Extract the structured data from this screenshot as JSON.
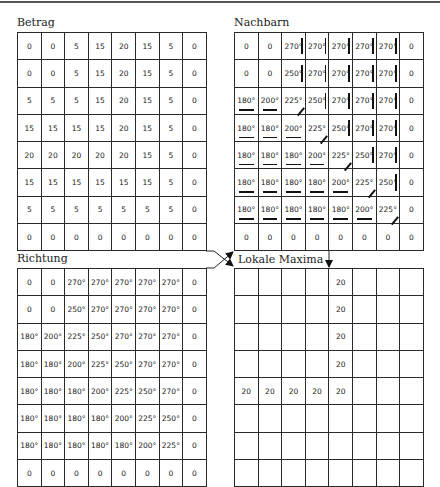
{
  "panels": {
    "betrag": {
      "title": "Betrag",
      "rows": [
        [
          "0",
          "0",
          "5",
          "15",
          "20",
          "15",
          "5",
          "0"
        ],
        [
          "0",
          "0",
          "5",
          "15",
          "20",
          "15",
          "5",
          "0"
        ],
        [
          "5",
          "5",
          "5",
          "15",
          "20",
          "15",
          "5",
          "0"
        ],
        [
          "15",
          "15",
          "15",
          "15",
          "20",
          "15",
          "5",
          "0"
        ],
        [
          "20",
          "20",
          "20",
          "20",
          "20",
          "15",
          "5",
          "0"
        ],
        [
          "15",
          "15",
          "15",
          "15",
          "15",
          "15",
          "5",
          "0"
        ],
        [
          "5",
          "5",
          "5",
          "5",
          "5",
          "5",
          "5",
          "0"
        ],
        [
          "0",
          "0",
          "0",
          "0",
          "0",
          "0",
          "0",
          "0"
        ]
      ]
    },
    "nachbarn": {
      "title": "Nachbarn",
      "rows": [
        [
          "0",
          "0",
          "270°",
          "270°",
          "270°",
          "270°",
          "270°",
          "0"
        ],
        [
          "0",
          "0",
          "250°",
          "270°",
          "270°",
          "270°",
          "270°",
          "0"
        ],
        [
          "180°",
          "200°",
          "225°",
          "250°",
          "270°",
          "270°",
          "270°",
          "0"
        ],
        [
          "180°",
          "180°",
          "200°",
          "225°",
          "250°",
          "270°",
          "270°",
          "0"
        ],
        [
          "180°",
          "180°",
          "180°",
          "200°",
          "225°",
          "250°",
          "270°",
          "0"
        ],
        [
          "180°",
          "180°",
          "180°",
          "180°",
          "200°",
          "225°",
          "250°",
          "0"
        ],
        [
          "180°",
          "180°",
          "180°",
          "180°",
          "180°",
          "200°",
          "225°",
          "0"
        ],
        [
          "0",
          "0",
          "0",
          "0",
          "0",
          "0",
          "0",
          "0"
        ]
      ],
      "markers": [
        [
          "none",
          "none",
          "vertical",
          "vertical",
          "vertical",
          "vertical",
          "vertical",
          "none"
        ],
        [
          "none",
          "none",
          "vertical",
          "vertical",
          "vertical",
          "vertical",
          "vertical",
          "none"
        ],
        [
          "underline",
          "underline",
          "diagonal",
          "vertical",
          "vertical",
          "vertical",
          "vertical",
          "none"
        ],
        [
          "underline",
          "underline",
          "underline",
          "diagonal",
          "vertical",
          "vertical",
          "vertical",
          "none"
        ],
        [
          "underline",
          "underline",
          "underline",
          "underline",
          "diagonal",
          "vertical",
          "vertical",
          "none"
        ],
        [
          "underline",
          "underline",
          "underline",
          "underline",
          "underline",
          "diagonal",
          "vertical",
          "none"
        ],
        [
          "underline",
          "underline",
          "underline",
          "underline",
          "underline",
          "underline",
          "diagonal",
          "none"
        ],
        [
          "none",
          "none",
          "none",
          "none",
          "none",
          "none",
          "none",
          "none"
        ]
      ]
    },
    "richtung": {
      "title": "Richtung",
      "rows": [
        [
          "0",
          "0",
          "270°",
          "270°",
          "270°",
          "270°",
          "270°",
          "0"
        ],
        [
          "0",
          "0",
          "250°",
          "270°",
          "270°",
          "270°",
          "270°",
          "0"
        ],
        [
          "180°",
          "200°",
          "225°",
          "250°",
          "270°",
          "270°",
          "270°",
          "0"
        ],
        [
          "180°",
          "180°",
          "200°",
          "225°",
          "250°",
          "270°",
          "270°",
          "0"
        ],
        [
          "180°",
          "180°",
          "180°",
          "200°",
          "225°",
          "250°",
          "270°",
          "0"
        ],
        [
          "180°",
          "180°",
          "180°",
          "180°",
          "200°",
          "225°",
          "250°",
          "0"
        ],
        [
          "180°",
          "180°",
          "180°",
          "180°",
          "180°",
          "200°",
          "225°",
          "0"
        ],
        [
          "0",
          "0",
          "0",
          "0",
          "0",
          "0",
          "0",
          "0"
        ]
      ]
    },
    "lokale_maxima": {
      "title": "Lokale Maxima",
      "rows": [
        [
          "",
          "",
          "",
          "",
          "20",
          "",
          "",
          ""
        ],
        [
          "",
          "",
          "",
          "",
          "20",
          "",
          "",
          ""
        ],
        [
          "",
          "",
          "",
          "",
          "20",
          "",
          "",
          ""
        ],
        [
          "",
          "",
          "",
          "",
          "20",
          "",
          "",
          ""
        ],
        [
          "20",
          "20",
          "20",
          "20",
          "20",
          "",
          "",
          ""
        ],
        [
          "",
          "",
          "",
          "",
          "",
          "",
          "",
          ""
        ],
        [
          "",
          "",
          "",
          "",
          "",
          "",
          "",
          ""
        ],
        [
          "",
          "",
          "",
          "",
          "",
          "",
          "",
          ""
        ]
      ]
    }
  },
  "connectors": [
    {
      "from": "betrag",
      "to": "lokale_maxima"
    },
    {
      "from": "richtung",
      "to": "nachbarn"
    },
    {
      "from": "nachbarn",
      "to": "lokale_maxima"
    }
  ]
}
